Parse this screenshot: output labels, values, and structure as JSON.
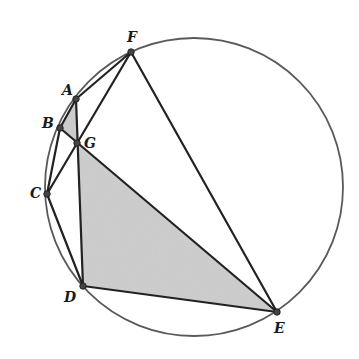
{
  "diagram": {
    "type": "geometry-cyclic-hexagon",
    "circle": {
      "cx": 194,
      "cy": 187,
      "r": 149,
      "stroke": "#5a5a5a"
    },
    "points": {
      "A": {
        "x": 76,
        "y": 99,
        "label": "A",
        "lx": 62,
        "ly": 95
      },
      "B": {
        "x": 60,
        "y": 128,
        "label": "B",
        "lx": 42,
        "ly": 128
      },
      "C": {
        "x": 47,
        "y": 194,
        "label": "C",
        "lx": 30,
        "ly": 198
      },
      "D": {
        "x": 83,
        "y": 286,
        "label": "D",
        "lx": 64,
        "ly": 302
      },
      "E": {
        "x": 277,
        "y": 312,
        "label": "E",
        "lx": 274,
        "ly": 333
      },
      "F": {
        "x": 131,
        "y": 52,
        "label": "F",
        "lx": 127,
        "ly": 42
      },
      "G": {
        "x": 77,
        "y": 143,
        "label": "G",
        "lx": 84,
        "ly": 148
      }
    },
    "labels": {
      "A": "A",
      "B": "B",
      "C": "C",
      "D": "D",
      "E": "E",
      "F": "F",
      "G": "G"
    },
    "segments": [
      [
        "F",
        "A"
      ],
      [
        "A",
        "B"
      ],
      [
        "B",
        "C"
      ],
      [
        "C",
        "D"
      ],
      [
        "D",
        "E"
      ],
      [
        "E",
        "F"
      ],
      [
        "B",
        "E"
      ],
      [
        "A",
        "D"
      ],
      [
        "C",
        "F"
      ]
    ],
    "shaded_regions": [
      {
        "name": "triangle-ABG",
        "vertices": [
          "A",
          "B",
          "G"
        ],
        "fill": "#cfcfcf"
      },
      {
        "name": "triangle-GDE",
        "vertices": [
          "G",
          "D",
          "E"
        ],
        "fill": "#cfcfcf"
      }
    ],
    "colors": {
      "line": "#222222",
      "circle": "#5a5a5a",
      "shade": "#d0d0d0",
      "point": "#444444"
    }
  }
}
